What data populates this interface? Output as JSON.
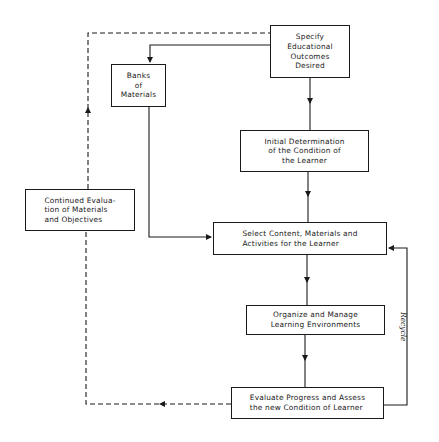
{
  "diagram": {
    "type": "flowchart",
    "colors": {
      "line": "#1a1a1a",
      "background": "#ffffff"
    },
    "nodes": {
      "specify": {
        "label": "Specify\nEducational\nOutcomes\nDesired"
      },
      "banks": {
        "label": "Banks\nof\nMaterials"
      },
      "initial": {
        "label": "Initial Determination\nof the Condition of\nthe Learner"
      },
      "continued": {
        "label": "Continued Evalua-\ntion of Materials\nand Objectives"
      },
      "select": {
        "label": "Select Content, Materials and\nActivities for the Learner"
      },
      "organize": {
        "label": "Organize and Manage\nLearning Environments"
      },
      "evaluate": {
        "label": "Evaluate Progress and Assess\nthe new Condition of Learner"
      }
    },
    "edges": [
      {
        "from": "specify",
        "to": "banks",
        "style": "solid"
      },
      {
        "from": "specify",
        "to": "initial",
        "style": "solid"
      },
      {
        "from": "initial",
        "to": "select",
        "style": "solid"
      },
      {
        "from": "banks",
        "to": "select",
        "style": "solid"
      },
      {
        "from": "select",
        "to": "organize",
        "style": "solid"
      },
      {
        "from": "organize",
        "to": "evaluate",
        "style": "solid"
      },
      {
        "from": "evaluate",
        "to": "select",
        "style": "solid",
        "label": "Recycle"
      },
      {
        "from": "evaluate",
        "to": "continued",
        "style": "dashed"
      },
      {
        "from": "continued",
        "to": "specify",
        "style": "dashed"
      }
    ],
    "recycle_label": "Recycle"
  }
}
